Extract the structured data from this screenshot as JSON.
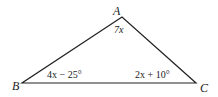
{
  "diagram": {
    "type": "triangle",
    "vertices": [
      {
        "name": "A",
        "x": 122,
        "y": 17
      },
      {
        "name": "B",
        "x": 22,
        "y": 83
      },
      {
        "name": "C",
        "x": 196,
        "y": 83
      }
    ],
    "angles": {
      "A": "7x",
      "B": "4x − 25°",
      "C": "2x + 10°"
    },
    "stroke_color": "#222222"
  }
}
